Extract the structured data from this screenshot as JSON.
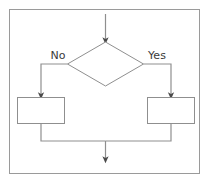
{
  "diagram": {
    "type": "flowchart",
    "frame": {
      "name": "outer-border",
      "x": 9,
      "y": 9,
      "width": 191,
      "height": 165,
      "stroke": "#9a9a9a",
      "fill": "#ffffff"
    },
    "palette": {
      "line": "#8f8f8f",
      "shape_stroke": "#8f8f8f",
      "shape_fill": "#ffffff",
      "text": "#3a3a3a",
      "background": "#ffffff"
    },
    "nodes": [
      {
        "id": "decision",
        "shape": "diamond",
        "label": "",
        "cx": 105.5,
        "cy": 64,
        "half_width": 38,
        "half_height": 22
      },
      {
        "id": "process-no",
        "shape": "rectangle",
        "label": "",
        "x": 17,
        "y": 97,
        "width": 48,
        "height": 27
      },
      {
        "id": "process-yes",
        "shape": "rectangle",
        "label": "",
        "x": 147,
        "y": 97,
        "width": 48,
        "height": 27
      }
    ],
    "edge_labels": [
      {
        "id": "label-no",
        "text": "No",
        "x": 58,
        "y": 59,
        "anchor": "middle"
      },
      {
        "id": "label-yes",
        "text": "Yes",
        "x": 157,
        "y": 59,
        "anchor": "middle"
      }
    ],
    "connectors": [
      {
        "id": "entry-arrow",
        "from": "top",
        "to": "decision",
        "path": "M105.5,14 L105.5,40",
        "arrowhead": "end"
      },
      {
        "id": "no-branch",
        "from": "decision-left",
        "to": "process-no",
        "path": "M68,64 L41,64 L41,95",
        "arrowhead": "end"
      },
      {
        "id": "yes-branch",
        "from": "decision-right",
        "to": "process-yes",
        "path": "M143,64 L171,64 L171,95",
        "arrowhead": "end"
      },
      {
        "id": "no-merge",
        "from": "process-no",
        "to": "merge-bar",
        "path": "M41,124 L41,141 L105.5,141",
        "arrowhead": "none"
      },
      {
        "id": "yes-merge",
        "from": "process-yes",
        "to": "merge-bar",
        "path": "M171,124 L171,141 L105.5,141",
        "arrowhead": "none"
      },
      {
        "id": "exit-arrow",
        "from": "merge-bar",
        "to": "bottom",
        "path": "M105.5,141 L105.5,160",
        "arrowhead": "end"
      }
    ]
  }
}
